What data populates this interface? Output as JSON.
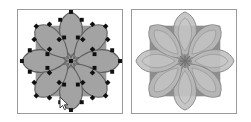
{
  "document": {
    "title": "Rosette Bezier Path Comparison",
    "background_color": "#ffffff",
    "width": 251,
    "height": 122
  },
  "figure": {
    "layout": "two-panels-side-by-side",
    "panel_border_color": "#9a9a9a",
    "panel_background": "#ffffff"
  },
  "panels": [
    {
      "id": "left",
      "name": "editing-view",
      "caption": "",
      "shows_control_points": true,
      "shows_cursor": true,
      "square": {
        "fill": "#9b9b9b",
        "x": 18,
        "y": 16,
        "size": 72
      },
      "rosette": {
        "petal_count": 8,
        "petal_fill": "#a3a3a3",
        "petal_stroke": "#5e5e5e",
        "center_star_color": "#6a6a6a",
        "outer_radius": 50,
        "inner_radius": 10
      },
      "control_points": {
        "marker_shape": "square",
        "marker_color": "#101010",
        "marker_size": 4,
        "count_per_petal": 5,
        "total": 40
      },
      "cursor": {
        "type": "arrow-pointer",
        "fill": "#ffffff",
        "stroke": "#2a2a2a",
        "x": 44,
        "y": 91
      }
    },
    {
      "id": "right",
      "name": "preview-view",
      "caption": "",
      "shows_control_points": false,
      "shows_cursor": false,
      "square": {
        "fill": "#8e8e8e",
        "x": 18,
        "y": 16,
        "size": 72
      },
      "rosette": {
        "petal_count": 8,
        "petal_fill": "#b9b9b9",
        "petal_fill_over_square": "#a7a7a7",
        "petal_stroke": "#8a8a8a",
        "center_star_color": "#7a7a7a",
        "outer_radius": 50,
        "inner_radius": 10
      }
    }
  ],
  "colors": {
    "square_gray": "#9b9b9b",
    "petal_gray": "#a3a3a3",
    "petal_light_gray": "#b9b9b9",
    "stroke_gray": "#5e5e5e",
    "marker_black": "#101010",
    "border_gray": "#9a9a9a",
    "page_white": "#ffffff"
  }
}
